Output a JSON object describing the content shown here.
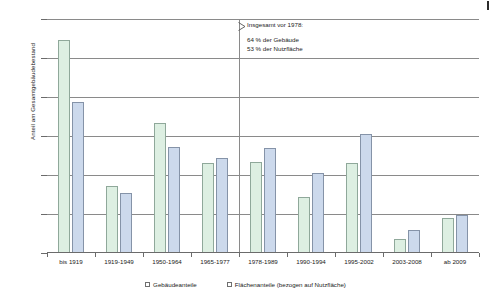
{
  "chart_data": {
    "type": "bar",
    "title": "",
    "xlabel": "",
    "ylabel": "Anteil am Gesamtgebäudebestand",
    "ylim": [
      0,
      30
    ],
    "ytick_labels": [
      "0 %",
      "5 %",
      "10 %",
      "15 %",
      "20 %",
      "25 %",
      "30 %"
    ],
    "ytick_values": [
      0,
      5,
      10,
      15,
      20,
      25,
      30
    ],
    "grid": true,
    "legend_position": "bottom",
    "categories": [
      "bis 1919",
      "1919-1949",
      "1950-1964",
      "1965-1977",
      "1978-1989",
      "1990-1994",
      "1995-2002",
      "2003-2008",
      "ab 2009"
    ],
    "series": [
      {
        "name": "Gebäudeanteile",
        "color": "#ddefe2",
        "values": [
          27.3,
          8.6,
          16.7,
          11.5,
          11.7,
          7.2,
          11.5,
          1.8,
          4.5
        ]
      },
      {
        "name": "Flächenanteile (bezogen auf Nutzfläche)",
        "color": "#ccd9ec",
        "values": [
          19.4,
          7.7,
          13.6,
          12.2,
          13.4,
          10.3,
          15.3,
          3.0,
          4.9
        ]
      }
    ],
    "annotation": {
      "heading": "Insgesamt vor 1978:",
      "line1": "64 % der Gebäude",
      "line2": "53 % der Nutzfläche",
      "divider_after_category": "1965-1977"
    }
  }
}
